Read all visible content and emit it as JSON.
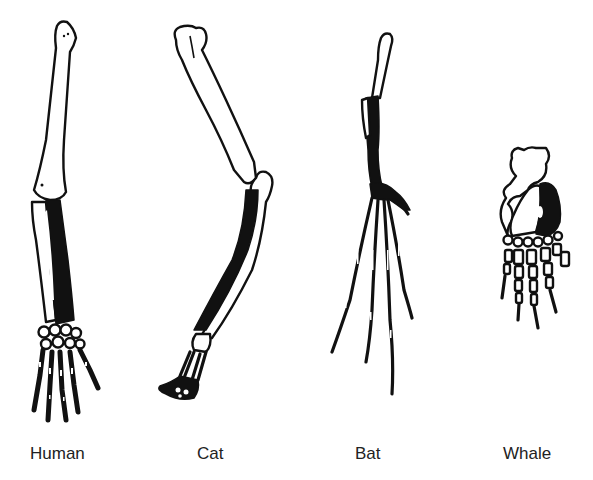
{
  "diagram": {
    "colors": {
      "background": "#ffffff",
      "ink": "#111111",
      "label": "#222222"
    },
    "limbs": [
      {
        "id": "human",
        "label": "Human"
      },
      {
        "id": "cat",
        "label": "Cat"
      },
      {
        "id": "bat",
        "label": "Bat"
      },
      {
        "id": "whale",
        "label": "Whale"
      }
    ]
  }
}
